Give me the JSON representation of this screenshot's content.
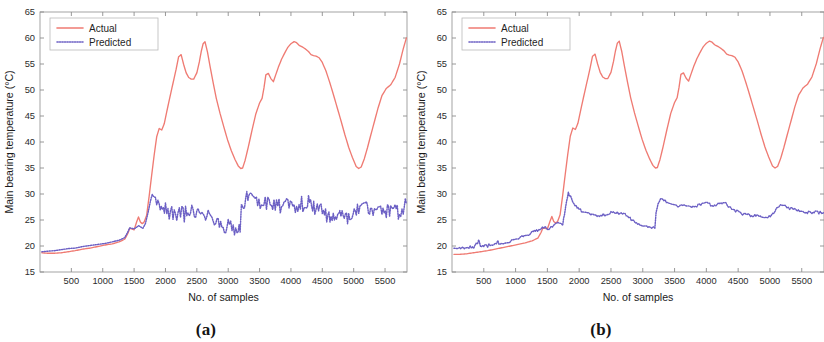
{
  "figure": {
    "background": "#ffffff",
    "panels": [
      {
        "id": "a",
        "caption": "(a)",
        "xlabel": "No. of samples",
        "ylabel": "Main bearing temperature (°C)"
      },
      {
        "id": "b",
        "caption": "(b)",
        "xlabel": "No. of samples",
        "ylabel": "Main bearing temperature (°C)"
      }
    ]
  },
  "colors": {
    "actual": "#ef7b73",
    "predicted": "#6b5fc4",
    "axis": "#9a9a9a",
    "text": "#1a1a1a",
    "background": "#ffffff"
  },
  "chart_data": [
    {
      "type": "line",
      "panel": "a",
      "title": "",
      "xlabel": "No. of samples",
      "ylabel": "Main bearing temperature (°C)",
      "xlim": [
        0,
        5850
      ],
      "ylim": [
        15,
        65
      ],
      "xticks": [
        500,
        1000,
        1500,
        2000,
        2500,
        3000,
        3500,
        4000,
        4500,
        5000,
        5500
      ],
      "yticks": [
        15,
        20,
        25,
        30,
        35,
        40,
        45,
        50,
        55,
        60,
        65
      ],
      "xtick_labels": [
        "500",
        "1000",
        "1500",
        "2000",
        "2500",
        "3000",
        "3500",
        "4000",
        "4500",
        "5000",
        "5500"
      ],
      "ytick_labels": [
        "15",
        "20",
        "25",
        "30",
        "35",
        "40",
        "45",
        "50",
        "55",
        "60",
        "65"
      ],
      "grid": false,
      "legend": {
        "position": "upper-left",
        "entries": [
          "Actual",
          "Predicted"
        ]
      },
      "series": [
        {
          "name": "Actual",
          "style": "solid",
          "color": "#ef7b73",
          "noise": 0.0,
          "x": [
            30,
            120,
            230,
            340,
            450,
            560,
            680,
            800,
            920,
            1040,
            1150,
            1260,
            1350,
            1400,
            1430,
            1460,
            1500,
            1540,
            1570,
            1600,
            1630,
            1660,
            1700,
            1740,
            1780,
            1820,
            1860,
            1900,
            1940,
            1980,
            2020,
            2070,
            2120,
            2170,
            2210,
            2250,
            2290,
            2330,
            2370,
            2410,
            2450,
            2500,
            2540,
            2570,
            2600,
            2630,
            2670,
            2710,
            2760,
            2810,
            2870,
            2930,
            2990,
            3050,
            3110,
            3160,
            3200,
            3230,
            3270,
            3320,
            3380,
            3440,
            3500,
            3540,
            3570,
            3600,
            3640,
            3680,
            3720,
            3760,
            3800,
            3850,
            3900,
            3950,
            4000,
            4050,
            4090,
            4130,
            4180,
            4230,
            4280,
            4320,
            4360,
            4400,
            4450,
            4500,
            4560,
            4620,
            4680,
            4740,
            4800,
            4860,
            4920,
            4980,
            5040,
            5080,
            5120,
            5170,
            5220,
            5270,
            5330,
            5390,
            5450,
            5520,
            5590,
            5660,
            5730,
            5790,
            5840
          ],
          "y": [
            18.7,
            18.6,
            18.6,
            18.7,
            18.9,
            19.1,
            19.4,
            19.6,
            19.9,
            20.2,
            20.4,
            20.8,
            21.3,
            22.4,
            23.4,
            23.3,
            23.1,
            24.6,
            25.6,
            24.6,
            24.3,
            24.6,
            25.9,
            29.6,
            33.6,
            37.5,
            41.0,
            42.6,
            42.3,
            43.5,
            45.8,
            48.6,
            51.3,
            54.0,
            56.4,
            56.8,
            54.9,
            53.3,
            52.4,
            52.1,
            52.1,
            53.3,
            55.4,
            57.4,
            58.9,
            59.3,
            57.3,
            54.6,
            51.4,
            48.4,
            45.5,
            42.9,
            40.4,
            38.3,
            36.6,
            35.4,
            34.9,
            35.0,
            36.5,
            39.0,
            42.3,
            45.4,
            47.5,
            48.4,
            50.4,
            52.9,
            53.2,
            52.2,
            51.6,
            53.0,
            54.4,
            55.9,
            57.1,
            58.2,
            58.9,
            59.3,
            59.1,
            58.6,
            58.3,
            57.9,
            57.4,
            56.8,
            56.6,
            56.5,
            56.2,
            55.3,
            53.6,
            51.4,
            49.0,
            46.5,
            44.0,
            41.4,
            39.0,
            37.0,
            35.3,
            34.9,
            35.2,
            36.8,
            38.9,
            41.2,
            43.9,
            46.6,
            48.9,
            50.3,
            51.0,
            52.4,
            55.0,
            57.9,
            60.0
          ]
        },
        {
          "name": "Predicted",
          "style": "dotted",
          "color": "#6b5fc4",
          "noise": 1.55,
          "noise_start_x": 1760,
          "x": [
            30,
            120,
            230,
            340,
            450,
            560,
            680,
            800,
            920,
            1040,
            1150,
            1260,
            1350,
            1400,
            1430,
            1460,
            1500,
            1540,
            1570,
            1600,
            1640,
            1680,
            1720,
            1760,
            1790,
            1820,
            1860,
            1900,
            1950,
            2000,
            2060,
            2120,
            2180,
            2240,
            2300,
            2360,
            2420,
            2480,
            2540,
            2600,
            2660,
            2720,
            2780,
            2840,
            2900,
            2960,
            3020,
            3080,
            3140,
            3190,
            3210,
            3240,
            3280,
            3330,
            3390,
            3450,
            3510,
            3570,
            3630,
            3690,
            3750,
            3810,
            3870,
            3930,
            3990,
            4050,
            4110,
            4170,
            4230,
            4280,
            4330,
            4380,
            4440,
            4500,
            4570,
            4640,
            4710,
            4780,
            4850,
            4920,
            4990,
            5060,
            5120,
            5170,
            5220,
            5270,
            5330,
            5390,
            5450,
            5520,
            5590,
            5660,
            5730,
            5790,
            5840
          ],
          "y": [
            18.9,
            19.0,
            19.1,
            19.3,
            19.5,
            19.6,
            19.9,
            20.1,
            20.3,
            20.5,
            20.8,
            21.1,
            21.6,
            22.7,
            23.5,
            23.4,
            23.3,
            23.6,
            23.9,
            23.7,
            23.4,
            24.3,
            26.3,
            28.6,
            30.1,
            29.5,
            28.4,
            27.9,
            27.4,
            27.0,
            26.6,
            26.4,
            26.3,
            26.2,
            26.1,
            26.1,
            26.3,
            26.4,
            26.3,
            26.2,
            26.0,
            25.6,
            25.0,
            24.5,
            24.1,
            23.9,
            23.6,
            23.5,
            23.6,
            23.8,
            26.5,
            28.4,
            29.2,
            29.0,
            28.5,
            28.1,
            27.8,
            27.9,
            28.0,
            27.7,
            27.5,
            27.6,
            27.8,
            28.1,
            28.2,
            27.9,
            27.8,
            28.0,
            28.3,
            28.2,
            27.9,
            27.4,
            26.8,
            26.4,
            26.1,
            25.9,
            25.8,
            25.7,
            25.7,
            25.6,
            25.7,
            26.6,
            27.6,
            27.9,
            27.7,
            27.4,
            27.2,
            27.0,
            26.9,
            26.7,
            26.5,
            26.4,
            26.6,
            27.3,
            28.4
          ]
        }
      ]
    },
    {
      "type": "line",
      "panel": "b",
      "title": "",
      "xlabel": "No. of samples",
      "ylabel": "Main bearing temperature (°C)",
      "xlim": [
        0,
        5850
      ],
      "ylim": [
        15,
        65
      ],
      "xticks": [
        500,
        1000,
        1500,
        2000,
        2500,
        3000,
        3500,
        4000,
        4500,
        5000,
        5500
      ],
      "yticks": [
        15,
        20,
        25,
        30,
        35,
        40,
        45,
        50,
        55,
        60,
        65
      ],
      "xtick_labels": [
        "500",
        "1000",
        "1500",
        "2000",
        "2500",
        "3000",
        "3500",
        "4000",
        "4500",
        "5000",
        "5500"
      ],
      "ytick_labels": [
        "15",
        "20",
        "25",
        "30",
        "35",
        "40",
        "45",
        "50",
        "55",
        "60",
        "65"
      ],
      "grid": false,
      "legend": {
        "position": "upper-left",
        "entries": [
          "Actual",
          "Predicted"
        ]
      },
      "series": [
        {
          "name": "Actual",
          "style": "solid",
          "color": "#ef7b73",
          "noise": 0.0,
          "x": [
            30,
            120,
            230,
            340,
            450,
            560,
            680,
            800,
            920,
            1040,
            1150,
            1260,
            1350,
            1400,
            1430,
            1460,
            1500,
            1540,
            1570,
            1600,
            1630,
            1660,
            1700,
            1740,
            1780,
            1820,
            1860,
            1900,
            1940,
            1980,
            2020,
            2070,
            2120,
            2170,
            2210,
            2250,
            2290,
            2330,
            2370,
            2410,
            2450,
            2500,
            2540,
            2570,
            2600,
            2630,
            2670,
            2710,
            2760,
            2810,
            2870,
            2930,
            2990,
            3050,
            3110,
            3160,
            3200,
            3230,
            3270,
            3320,
            3380,
            3440,
            3500,
            3540,
            3570,
            3600,
            3640,
            3680,
            3720,
            3760,
            3800,
            3850,
            3900,
            3950,
            4000,
            4050,
            4090,
            4130,
            4180,
            4230,
            4280,
            4320,
            4360,
            4400,
            4450,
            4500,
            4560,
            4620,
            4680,
            4740,
            4800,
            4860,
            4920,
            4980,
            5040,
            5080,
            5120,
            5170,
            5220,
            5270,
            5330,
            5390,
            5450,
            5520,
            5590,
            5660,
            5730,
            5790,
            5840
          ],
          "y": [
            18.4,
            18.4,
            18.5,
            18.7,
            18.9,
            19.1,
            19.4,
            19.7,
            20.0,
            20.3,
            20.6,
            21.0,
            21.5,
            22.6,
            23.5,
            23.4,
            23.3,
            24.7,
            25.7,
            24.7,
            24.4,
            24.7,
            26.0,
            29.7,
            33.7,
            37.6,
            41.1,
            42.7,
            42.4,
            43.6,
            45.9,
            48.7,
            51.4,
            54.1,
            56.5,
            56.9,
            55.0,
            53.4,
            52.5,
            52.2,
            52.2,
            53.4,
            55.5,
            57.5,
            59.0,
            59.4,
            57.4,
            54.7,
            51.5,
            48.5,
            45.6,
            43.0,
            40.5,
            38.4,
            36.7,
            35.5,
            35.0,
            35.1,
            36.6,
            39.1,
            42.4,
            45.5,
            47.6,
            48.5,
            50.5,
            53.0,
            53.3,
            52.3,
            51.7,
            53.1,
            54.5,
            56.0,
            57.2,
            58.3,
            59.0,
            59.4,
            59.2,
            58.7,
            58.4,
            58.0,
            57.5,
            56.9,
            56.7,
            56.6,
            56.3,
            55.4,
            53.7,
            51.5,
            49.1,
            46.6,
            44.1,
            41.5,
            39.1,
            37.1,
            35.4,
            35.0,
            35.3,
            36.9,
            39.0,
            41.3,
            44.0,
            46.7,
            49.0,
            50.4,
            51.1,
            52.5,
            55.1,
            58.0,
            60.1
          ]
        },
        {
          "name": "Predicted",
          "style": "dotted",
          "color": "#6b5fc4",
          "noise": 0.28,
          "noise_start_x": 0,
          "x": [
            30,
            120,
            230,
            340,
            400,
            420,
            450,
            470,
            500,
            540,
            580,
            640,
            700,
            720,
            740,
            760,
            800,
            860,
            920,
            980,
            1040,
            1100,
            1160,
            1220,
            1280,
            1330,
            1380,
            1420,
            1460,
            1500,
            1540,
            1580,
            1620,
            1660,
            1700,
            1740,
            1770,
            1800,
            1830,
            1860,
            1900,
            1950,
            2000,
            2060,
            2120,
            2180,
            2240,
            2300,
            2360,
            2420,
            2480,
            2540,
            2600,
            2660,
            2720,
            2780,
            2840,
            2900,
            2960,
            3020,
            3080,
            3140,
            3190,
            3210,
            3240,
            3280,
            3330,
            3390,
            3450,
            3510,
            3570,
            3630,
            3690,
            3750,
            3810,
            3870,
            3930,
            3990,
            4050,
            4110,
            4170,
            4230,
            4280,
            4330,
            4380,
            4440,
            4500,
            4570,
            4640,
            4710,
            4780,
            4850,
            4920,
            4990,
            5060,
            5120,
            5170,
            5220,
            5270,
            5330,
            5390,
            5450,
            5520,
            5590,
            5660,
            5730,
            5790,
            5840
          ],
          "y": [
            19.6,
            19.6,
            19.7,
            19.8,
            20.6,
            21.1,
            20.1,
            19.9,
            20.0,
            20.0,
            20.1,
            20.2,
            20.3,
            21.2,
            20.5,
            20.3,
            20.4,
            20.6,
            20.9,
            21.2,
            21.5,
            21.8,
            22.1,
            22.4,
            22.7,
            23.0,
            23.3,
            23.6,
            23.5,
            23.4,
            23.4,
            23.7,
            24.0,
            24.3,
            24.2,
            24.0,
            26.2,
            28.5,
            30.1,
            29.5,
            28.4,
            27.6,
            27.0,
            26.6,
            26.3,
            26.1,
            26.0,
            25.9,
            25.9,
            26.1,
            26.3,
            26.4,
            26.4,
            26.2,
            26.0,
            25.5,
            25.0,
            24.5,
            24.1,
            23.8,
            23.6,
            23.5,
            23.6,
            26.4,
            28.2,
            29.0,
            28.8,
            28.3,
            28.0,
            27.8,
            27.8,
            28.0,
            27.7,
            27.5,
            27.6,
            27.8,
            28.0,
            28.2,
            28.0,
            27.8,
            28.0,
            28.3,
            28.2,
            27.9,
            27.4,
            26.9,
            26.5,
            26.2,
            26.0,
            25.9,
            25.8,
            25.7,
            25.6,
            25.7,
            26.5,
            27.6,
            27.9,
            27.7,
            27.4,
            27.2,
            27.0,
            26.9,
            26.7,
            26.5,
            26.4,
            26.5,
            26.4,
            26.3
          ]
        }
      ]
    }
  ]
}
